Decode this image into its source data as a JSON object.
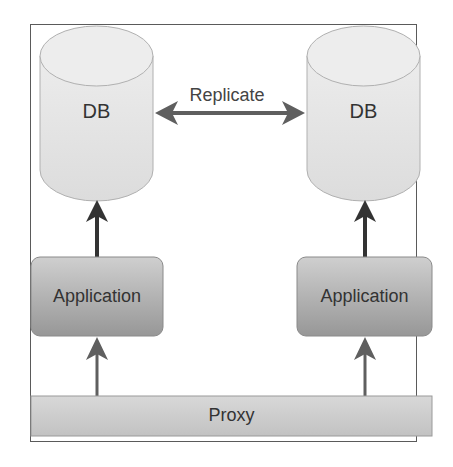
{
  "diagram": {
    "type": "architecture",
    "nodes": {
      "db_left": {
        "label": "DB",
        "shape": "cylinder"
      },
      "db_right": {
        "label": "DB",
        "shape": "cylinder"
      },
      "app_left": {
        "label": "Application",
        "shape": "rounded-rect"
      },
      "app_right": {
        "label": "Application",
        "shape": "rounded-rect"
      },
      "proxy": {
        "label": "Proxy",
        "shape": "rect"
      }
    },
    "edges": [
      {
        "from": "db_left",
        "to": "db_right",
        "label": "Replicate",
        "direction": "bidirectional"
      },
      {
        "from": "app_left",
        "to": "db_left",
        "label": "",
        "direction": "forward"
      },
      {
        "from": "app_right",
        "to": "db_right",
        "label": "",
        "direction": "forward"
      },
      {
        "from": "proxy",
        "to": "app_left",
        "label": "",
        "direction": "forward"
      },
      {
        "from": "proxy",
        "to": "app_right",
        "label": "",
        "direction": "forward"
      }
    ],
    "colors": {
      "cylinder_fill": "#e4e4e4",
      "cylinder_stroke": "#b0b0b0",
      "app_fill_top": "#c8c8c8",
      "app_fill_bottom": "#9a9a9a",
      "proxy_fill": "#cfcfcf",
      "arrow_dark": "#333333",
      "arrow_gray": "#5f5f5f",
      "frame": "#5a5a5a"
    }
  }
}
